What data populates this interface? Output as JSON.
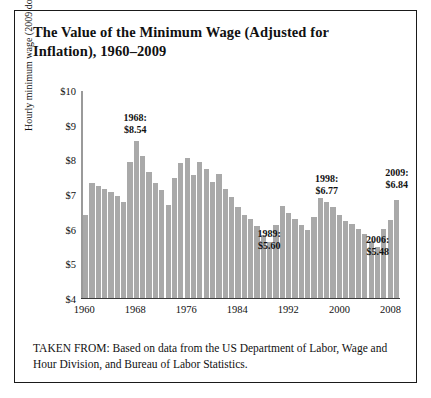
{
  "figure": {
    "title": "The Value of the Minimum Wage (Adjusted for Inflation), 1960–2009",
    "caption": "TAKEN FROM: Based on data from the US Department of Labor, Wage and Hour Division, and Bureau of Labor Statistics."
  },
  "chart_data": {
    "type": "bar",
    "title": "The Value of the Minimum Wage (Adjusted for Inflation), 1960–2009",
    "xlabel": "",
    "ylabel": "Hourly minimum wage (2009 dollars)",
    "ylim": [
      4,
      10
    ],
    "ytick_labels": [
      "$4",
      "$5",
      "$6",
      "$7",
      "$8",
      "$9",
      "$10"
    ],
    "ytick_values": [
      4,
      5,
      6,
      7,
      8,
      9,
      10
    ],
    "xtick_labels": [
      "1960",
      "1968",
      "1976",
      "1984",
      "1992",
      "2000",
      "2008"
    ],
    "xtick_values": [
      1960,
      1968,
      1976,
      1984,
      1992,
      2000,
      2008
    ],
    "grid": false,
    "legend": false,
    "bar_color": "#a9a9a9",
    "categories": [
      1960,
      1961,
      1962,
      1963,
      1964,
      1965,
      1966,
      1967,
      1968,
      1969,
      1970,
      1971,
      1972,
      1973,
      1974,
      1975,
      1976,
      1977,
      1978,
      1979,
      1980,
      1981,
      1982,
      1983,
      1984,
      1985,
      1986,
      1987,
      1988,
      1989,
      1990,
      1991,
      1992,
      1993,
      1994,
      1995,
      1996,
      1997,
      1998,
      1999,
      2000,
      2001,
      2002,
      2003,
      2004,
      2005,
      2006,
      2007,
      2008,
      2009
    ],
    "values": [
      6.4,
      7.32,
      7.25,
      7.16,
      7.07,
      6.96,
      6.77,
      7.94,
      8.54,
      8.1,
      7.66,
      7.34,
      7.11,
      6.69,
      7.48,
      7.9,
      8.05,
      7.56,
      7.93,
      7.74,
      7.37,
      7.58,
      7.14,
      6.92,
      6.63,
      6.4,
      6.29,
      6.07,
      5.83,
      5.6,
      6.11,
      6.67,
      6.47,
      6.28,
      6.12,
      5.95,
      6.33,
      6.88,
      6.77,
      6.62,
      6.41,
      6.23,
      6.13,
      5.99,
      5.84,
      5.64,
      5.48,
      5.98,
      6.25,
      6.84
    ],
    "annotations": [
      {
        "year": 1968,
        "year_label": "1968:",
        "value_label": "$8.54",
        "value": 8.54
      },
      {
        "year": 1989,
        "year_label": "1989:",
        "value_label": "$5.60",
        "value": 5.6
      },
      {
        "year": 1998,
        "year_label": "1998:",
        "value_label": "$6.77",
        "value": 6.77
      },
      {
        "year": 2006,
        "year_label": "2006:",
        "value_label": "$5.48",
        "value": 5.48
      },
      {
        "year": 2009,
        "year_label": "2009:",
        "value_label": "$6.84",
        "value": 6.84
      }
    ]
  }
}
